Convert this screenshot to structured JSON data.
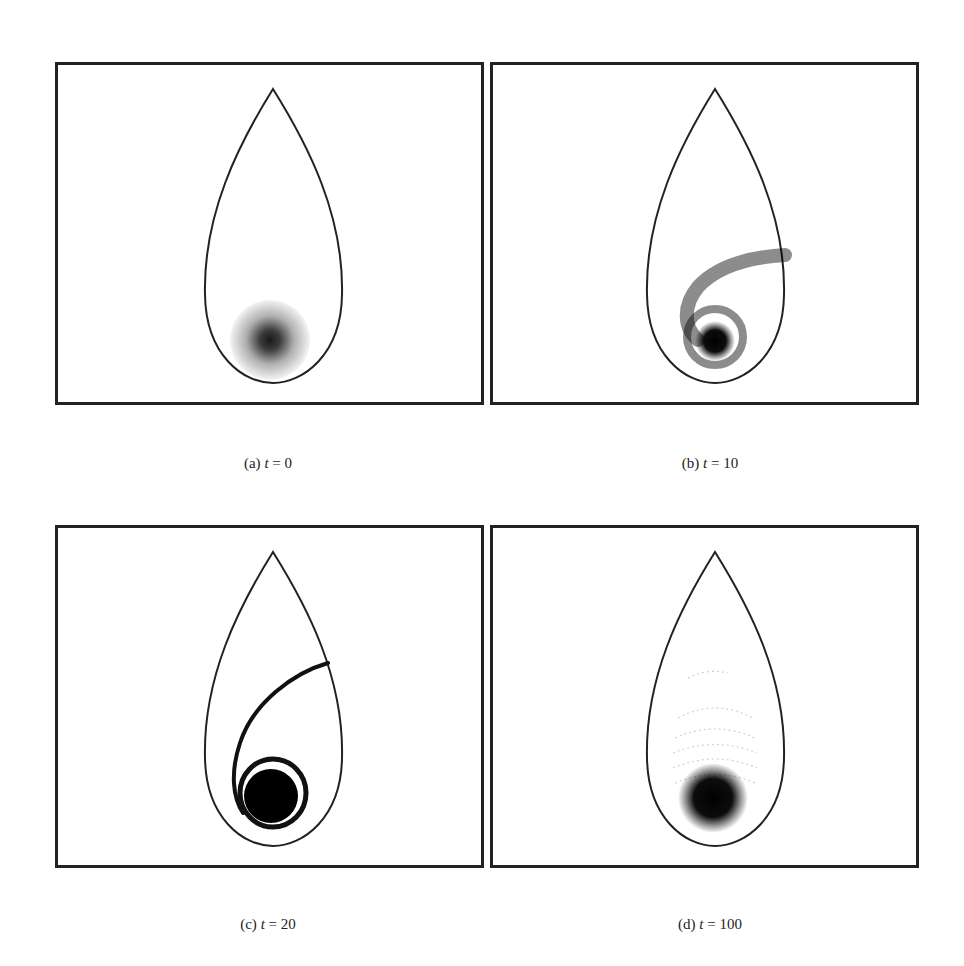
{
  "figure": {
    "panels": [
      {
        "id": "a",
        "label": "(a)",
        "var": "t",
        "eq": " = ",
        "value": "0",
        "state": "initial-gaussian-blob"
      },
      {
        "id": "b",
        "label": "(b)",
        "var": "t",
        "eq": " = ",
        "value": "10",
        "state": "stretching-filament"
      },
      {
        "id": "c",
        "label": "(c)",
        "var": "t",
        "eq": " = ",
        "value": "20",
        "state": "spiral-filament"
      },
      {
        "id": "d",
        "label": "(d)",
        "var": "t",
        "eq": " = ",
        "value": "100",
        "state": "mixed-blob-with-faint-arcs"
      }
    ],
    "colors": {
      "frame": "#222222",
      "boundary": "#222222",
      "density": "#000000",
      "background": "#ffffff"
    }
  }
}
